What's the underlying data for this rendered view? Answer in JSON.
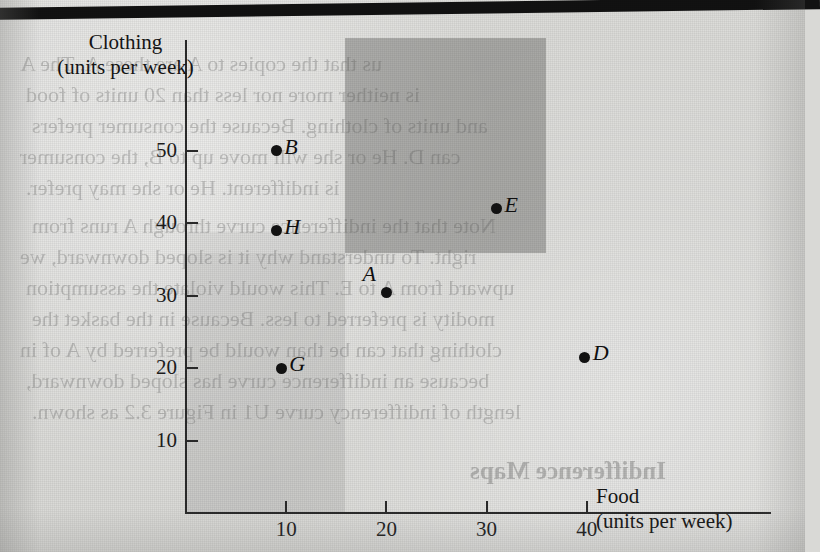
{
  "page": {
    "artifacts": {
      "top_bar": "black-scan-bar"
    },
    "bleed_through_text": [
      "us that the copies to A are these A. The A",
      "is neither more nor less than 20 units of food",
      "and units of clothing. Because the consumer prefers",
      "can D. He or she will move up to B, the consumer",
      "is indifferent. He or she may prefer.",
      "Note that the indifference curve through A runs from",
      "right. To understand why it is sloped downward, we",
      "upward from A to E. This would violate the assumption",
      "modity is preferred to less. Because in the basket the",
      "clothing that can be than would be preferred by A of in",
      "because an indifference curve has sloped downward,",
      "length of indifferency curve U1 in Figure 3.2 as shown.",
      "Indifference Maps"
    ]
  },
  "chart_data": {
    "type": "scatter",
    "title": "",
    "xlabel": "Food",
    "xlabel_units": "(units per week)",
    "ylabel": "Clothing",
    "ylabel_units": "(units per week)",
    "xlim": [
      0,
      52
    ],
    "ylim": [
      0,
      58
    ],
    "xticks": [
      "10",
      "20",
      "30",
      "40"
    ],
    "xtick_values": [
      10,
      20,
      30,
      40
    ],
    "yticks": [
      "10",
      "20",
      "30",
      "40",
      "50"
    ],
    "ytick_values": [
      10,
      20,
      30,
      40,
      50
    ],
    "grid": false,
    "legend": false,
    "points": [
      {
        "label": "B",
        "x": 9,
        "y": 50,
        "label_pos": "right"
      },
      {
        "label": "H",
        "x": 9,
        "y": 39,
        "label_pos": "right"
      },
      {
        "label": "A",
        "x": 20,
        "y": 30.5,
        "label_pos": "upper-left"
      },
      {
        "label": "E",
        "x": 31,
        "y": 42,
        "label_pos": "right"
      },
      {
        "label": "D",
        "x": 39.8,
        "y": 21.5,
        "label_pos": "right"
      },
      {
        "label": "G",
        "x": 9.5,
        "y": 20,
        "label_pos": "right"
      }
    ],
    "regions": [
      {
        "name": "preferred-to-A",
        "shade": "dark",
        "color": "#60605e",
        "x0": 20,
        "y0": 30.5,
        "x1": 44,
        "y1": 55.5
      },
      {
        "name": "less-preferred-than-A",
        "shade": "light",
        "color": "#787876",
        "x0": 0,
        "y0": 0,
        "x1": 20,
        "y1": 30.5
      }
    ]
  }
}
